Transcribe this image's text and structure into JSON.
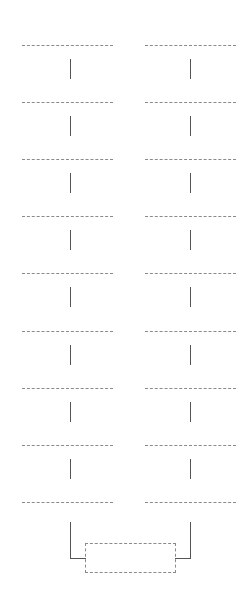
{
  "diagram": {
    "type": "two-column flow of placeholder nodes",
    "columns": [
      {
        "name": "left",
        "node_count": 9
      },
      {
        "name": "right",
        "node_count": 9
      }
    ],
    "merge_node": {
      "label": ""
    },
    "colors": {
      "dashed_border": "#8a8a8a",
      "connector": "#555555",
      "background": "#ffffff"
    }
  }
}
